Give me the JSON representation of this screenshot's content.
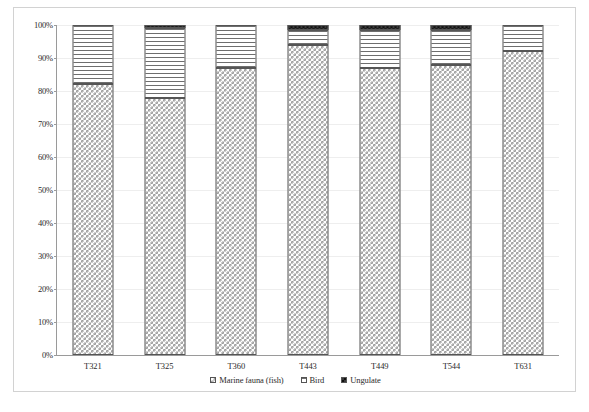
{
  "chart_data": {
    "type": "bar",
    "stacked": true,
    "normalized_percent": true,
    "title": "",
    "xlabel": "",
    "ylabel": "",
    "ylim": [
      0,
      100
    ],
    "yticks": [
      "0%",
      "10%",
      "20%",
      "30%",
      "40%",
      "50%",
      "60%",
      "70%",
      "80%",
      "90%",
      "100%"
    ],
    "ytick_values": [
      0,
      10,
      20,
      30,
      40,
      50,
      60,
      70,
      80,
      90,
      100
    ],
    "grid": true,
    "legend_position": "bottom",
    "categories": [
      "T321",
      "T325",
      "T360",
      "T443",
      "T449",
      "T544",
      "T631"
    ],
    "series": [
      {
        "name": "Marine fauna (fish)",
        "pattern": "checker",
        "values": [
          82,
          78,
          87,
          94,
          87,
          88,
          92
        ]
      },
      {
        "name": "Bird",
        "pattern": "horizontal-lines",
        "values": [
          18,
          21.2,
          13,
          4.5,
          11.5,
          10.5,
          8
        ]
      },
      {
        "name": "Ungulate",
        "pattern": "dark-solid",
        "values": [
          0,
          0.8,
          0,
          1.5,
          1.5,
          1.5,
          0
        ]
      }
    ]
  },
  "legend": {
    "items": [
      {
        "label": "Marine fauna (fish)"
      },
      {
        "label": "Bird"
      },
      {
        "label": "Ungulate"
      }
    ]
  }
}
